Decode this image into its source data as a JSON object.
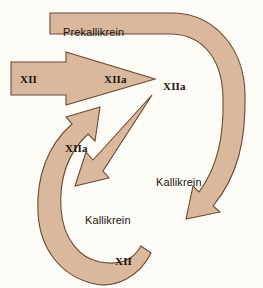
{
  "diagram": {
    "background_color": "#fdfbf5",
    "band_fill_color": "#d9b89d",
    "band_stroke_color": "#6b4a33",
    "text_color": "#1b1510",
    "labels": [
      {
        "id": "prekallikrein",
        "text": "Prekallikrein",
        "style": "name",
        "x": 63,
        "y": 27
      },
      {
        "id": "xii-input",
        "text": "XII",
        "style": "roman",
        "x": 20,
        "y": 74
      },
      {
        "id": "xiia-arrowhead",
        "text": "XIIa",
        "style": "roman",
        "x": 104,
        "y": 74
      },
      {
        "id": "xiia-center",
        "text": "XIIa",
        "style": "roman",
        "x": 163,
        "y": 81
      },
      {
        "id": "xiia-left-band",
        "text": "XIIa",
        "style": "roman",
        "x": 65,
        "y": 143
      },
      {
        "id": "kallikrein-right-band",
        "text": "Kallikrein",
        "style": "name",
        "x": 156,
        "y": 177
      },
      {
        "id": "kallikrein-center",
        "text": "Kallikrein",
        "style": "name",
        "x": 85,
        "y": 215
      },
      {
        "id": "xii-output",
        "text": "XII",
        "style": "roman",
        "x": 115,
        "y": 256
      }
    ]
  }
}
